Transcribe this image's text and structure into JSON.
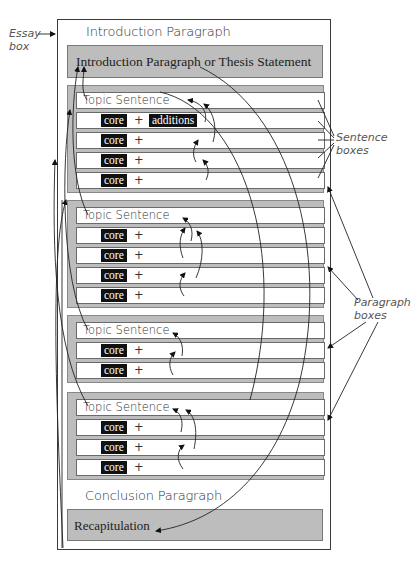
{
  "annotations": {
    "essay_box": [
      "Essay",
      "box"
    ],
    "sentence_boxes": [
      "Sentence",
      "boxes"
    ],
    "paragraph_boxes": [
      "Paragraph",
      "boxes"
    ]
  },
  "essay": {
    "intro_label": "Introduction Paragraph",
    "intro_bar": "Introduction Paragraph or Thesis Statement",
    "conclusion_label": "Conclusion Paragraph",
    "conclusion_bar": "Recapitulation",
    "paragraphs": [
      {
        "topic": "Topic Sentence",
        "sentences": [
          {
            "core": "core",
            "plus": "+",
            "additions": "additions"
          },
          {
            "core": "core",
            "plus": "+"
          },
          {
            "core": "core",
            "plus": "+"
          },
          {
            "core": "core",
            "plus": "+"
          }
        ]
      },
      {
        "topic": "Topic Sentence",
        "sentences": [
          {
            "core": "core",
            "plus": "+"
          },
          {
            "core": "core",
            "plus": "+"
          },
          {
            "core": "core",
            "plus": "+"
          },
          {
            "core": "core",
            "plus": "+"
          }
        ]
      },
      {
        "topic": "Topic Sentence",
        "sentences": [
          {
            "core": "core",
            "plus": "+"
          },
          {
            "core": "core",
            "plus": "+"
          }
        ]
      },
      {
        "topic": "Topic Sentence",
        "sentences": [
          {
            "core": "core",
            "plus": "+"
          },
          {
            "core": "core",
            "plus": "+"
          },
          {
            "core": "core",
            "plus": "+"
          }
        ]
      }
    ]
  },
  "colors": {
    "box_gray": "#bdbdbd",
    "highlight_black": "#111111",
    "border": "#3a3a3a"
  }
}
